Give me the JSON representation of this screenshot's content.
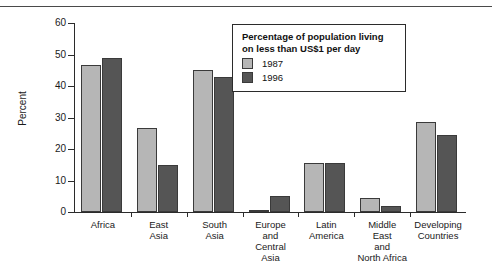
{
  "figure": {
    "y_axis_title": "Percent",
    "y_ticks": [
      "60",
      "50",
      "40",
      "30",
      "20",
      "10",
      "0"
    ]
  },
  "legend": {
    "title": "Percentage of population living on less than US$1 per day",
    "entries": [
      {
        "label": "1987",
        "color": "#b6b6b6"
      },
      {
        "label": "1996",
        "color": "#555555"
      }
    ]
  },
  "chart_data": {
    "type": "bar",
    "title": "Percentage of population living on less than US$1 per day",
    "xlabel": "",
    "ylabel": "Percent",
    "ylim": [
      0,
      60
    ],
    "ytick_step": 10,
    "grid": false,
    "legend_position": "top-right-inside",
    "categories": [
      "Africa",
      "East Asia",
      "South Asia",
      "Europe and Central Asia",
      "Latin America",
      "Middle East and North Africa",
      "Developing Countries"
    ],
    "category_lines": [
      [
        "Africa"
      ],
      [
        "East",
        "Asia"
      ],
      [
        "South",
        "Asia"
      ],
      [
        "Europe",
        "and",
        "Central",
        "Asia"
      ],
      [
        "Latin",
        "America"
      ],
      [
        "Middle",
        "East",
        "and",
        "North Africa"
      ],
      [
        "Developing",
        "Countries"
      ]
    ],
    "series": [
      {
        "name": "1987",
        "color": "#b6b6b6",
        "values": [
          46.7,
          26.6,
          45.2,
          0.6,
          15.6,
          4.3,
          28.5
        ]
      },
      {
        "name": "1996",
        "color": "#555555",
        "values": [
          49.0,
          15.0,
          43.0,
          5.1,
          15.6,
          1.9,
          24.5
        ]
      }
    ]
  }
}
